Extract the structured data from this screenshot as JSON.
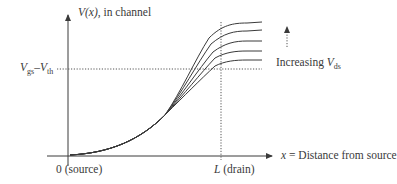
{
  "diagram": {
    "y_axis_label_var": "V",
    "y_axis_label_arg": "(x)",
    "y_axis_label_rest": ", in channel",
    "x_axis_label_var": "x",
    "x_axis_label_rest": " = Distance from source",
    "origin_label": "0 (source)",
    "drain_label_var": "L",
    "drain_label_rest": " (drain)",
    "threshold_label": {
      "v1": "V",
      "s1": "gs",
      "dash": "–",
      "v2": "V",
      "s2": "th"
    },
    "increasing_label": {
      "text": "Increasing ",
      "var": "V",
      "sub": "ds"
    },
    "curves_count": 5,
    "colors": {
      "line": "#3a3a3a",
      "dotted": "#555555"
    }
  }
}
